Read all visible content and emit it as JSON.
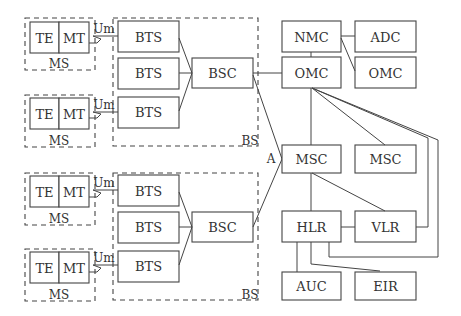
{
  "diagram": {
    "mobile_stations": [
      {
        "id": "ms1",
        "label": "MS",
        "te": "TE",
        "mt": "MT",
        "interface": "Um"
      },
      {
        "id": "ms2",
        "label": "MS",
        "te": "TE",
        "mt": "MT",
        "interface": "Um"
      },
      {
        "id": "ms3",
        "label": "MS",
        "te": "TE",
        "mt": "MT",
        "interface": "Um"
      },
      {
        "id": "ms4",
        "label": "MS",
        "te": "TE",
        "mt": "MT",
        "interface": "Um"
      }
    ],
    "base_stations": [
      {
        "id": "bs1",
        "label": "BS",
        "bts": [
          "BTS",
          "BTS",
          "BTS"
        ],
        "bsc": "BSC"
      },
      {
        "id": "bs2",
        "label": "BS",
        "bts": [
          "BTS",
          "BTS",
          "BTS"
        ],
        "bsc": "BSC"
      }
    ],
    "a_interface": "A",
    "core": {
      "nmc": "NMC",
      "adc": "ADC",
      "omc_left": "OMC",
      "omc_right": "OMC",
      "msc_left": "MSC",
      "msc_right": "MSC",
      "hlr": "HLR",
      "vlr": "VLR",
      "auc": "AUC",
      "eir": "EIR"
    }
  }
}
